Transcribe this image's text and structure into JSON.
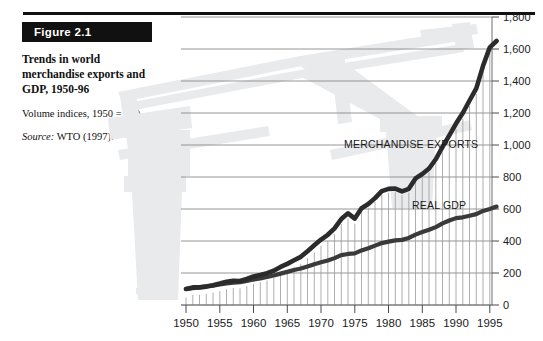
{
  "figure": {
    "tag": "Figure 2.1",
    "title": "Trends in world merchandise exports and GDP, 1950-96",
    "subtitle": "Volume indices, 1950 = 100",
    "source_label": "Source:",
    "source_text": " WTO (1997)."
  },
  "colors": {
    "ink": "#111111",
    "series_line": "#3a3a3a",
    "gridline": "#8a8a8a",
    "minor_gridline": "#9a9a9a",
    "watermark": "#e9eaec",
    "tag_bg": "#111111",
    "tag_fg": "#ffffff"
  },
  "chart_data": {
    "type": "line",
    "title": "Trends in world merchandise exports and GDP, 1950-96",
    "subtitle": "Volume indices, 1950 = 100",
    "xlabel": "",
    "ylabel": "",
    "xlim": [
      1950,
      1996
    ],
    "ylim": [
      0,
      1800
    ],
    "grid": true,
    "legend_position": "inline-annotation",
    "y_ticks": [
      0,
      200,
      400,
      600,
      800,
      1000,
      1200,
      1400,
      1600,
      1800
    ],
    "y_tick_labels": [
      "0",
      "200",
      "400",
      "600",
      "800",
      "1,000",
      "1,200",
      "1,400",
      "1,600",
      "1,800"
    ],
    "x_ticks": [
      1950,
      1955,
      1960,
      1965,
      1970,
      1975,
      1980,
      1985,
      1990,
      1995
    ],
    "x_tick_labels": [
      "1950",
      "1955",
      "1960",
      "1965",
      "1970",
      "1975",
      "1980",
      "1985",
      "1990",
      "1995"
    ],
    "x_minor_tick_step": 1,
    "x": [
      1950,
      1951,
      1952,
      1953,
      1954,
      1955,
      1956,
      1957,
      1958,
      1959,
      1960,
      1961,
      1962,
      1963,
      1964,
      1965,
      1966,
      1967,
      1968,
      1969,
      1970,
      1971,
      1972,
      1973,
      1974,
      1975,
      1976,
      1977,
      1978,
      1979,
      1980,
      1981,
      1982,
      1983,
      1984,
      1985,
      1986,
      1987,
      1988,
      1989,
      1990,
      1991,
      1992,
      1993,
      1994,
      1995,
      1996
    ],
    "series": [
      {
        "name": "MERCHANDISE EXPORTS",
        "label": "MERCHANDISE EXPORTS",
        "values": [
          100,
          110,
          110,
          115,
          124,
          134,
          145,
          152,
          150,
          163,
          178,
          188,
          199,
          214,
          238,
          257,
          280,
          301,
          336,
          373,
          409,
          439,
          479,
          537,
          573,
          540,
          605,
          631,
          668,
          712,
          726,
          728,
          710,
          726,
          791,
          819,
          853,
          911,
          988,
          1060,
          1134,
          1200,
          1278,
          1354,
          1495,
          1610,
          1650
        ]
      },
      {
        "name": "REAL GDP",
        "label": "REAL GDP",
        "values": [
          100,
          105,
          110,
          116,
          121,
          129,
          135,
          140,
          143,
          151,
          159,
          166,
          175,
          184,
          196,
          207,
          219,
          228,
          241,
          255,
          267,
          278,
          293,
          312,
          319,
          323,
          341,
          355,
          371,
          387,
          396,
          404,
          407,
          419,
          440,
          456,
          470,
          487,
          510,
          528,
          543,
          548,
          558,
          568,
          588,
          600,
          615
        ]
      }
    ],
    "annotations": [
      {
        "text": "MERCHANDISE EXPORTS",
        "x": 1976,
        "y": 1020
      },
      {
        "text": "REAL GDP",
        "x": 1990,
        "y": 640
      }
    ]
  }
}
